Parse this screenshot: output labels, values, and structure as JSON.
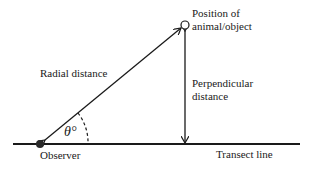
{
  "diagram": {
    "labels": {
      "object": [
        "Position of",
        "animal/object"
      ],
      "radial": "Radial distance",
      "perpendicular": [
        "Perpendicular",
        "distance"
      ],
      "angle": "θ°",
      "observer": "Observer",
      "transect": "Transect line"
    },
    "colors": {
      "stroke": "#1a1a1a",
      "background": "#ffffff"
    }
  }
}
